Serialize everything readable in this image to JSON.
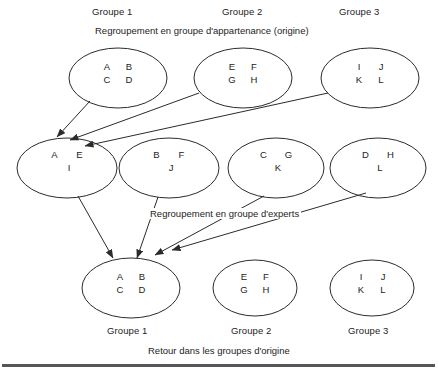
{
  "figure": {
    "title_top_caption": "Regroupement en groupe d'appartenance (origine)",
    "middle_caption": "Regroupement en groupe d'experts",
    "bottom_caption": "Retour dans les groupes d'origine",
    "top_group_labels": [
      "Groupe 1",
      "Groupe 2",
      "Groupe 3"
    ],
    "bottom_group_labels": [
      "Groupe 1",
      "Groupe 2",
      "Groupe 3"
    ],
    "stroke_color": "#2b2b2b",
    "rule_color": "#56565a",
    "text_color": "#1d1d1d",
    "background_color": "#ffffff"
  },
  "rows": {
    "origin_top": [
      {
        "name": "Groupe 1",
        "line1": [
          "A",
          "B"
        ],
        "line2": [
          "C",
          "D"
        ]
      },
      {
        "name": "Groupe 2",
        "line1": [
          "E",
          "F"
        ],
        "line2": [
          "G",
          "H"
        ]
      },
      {
        "name": "Groupe 3",
        "line1": [
          "I",
          "J"
        ],
        "line2": [
          "K",
          "L"
        ]
      }
    ],
    "experts_middle": [
      {
        "line1": [
          "A",
          "E"
        ],
        "line2": [
          "I"
        ]
      },
      {
        "line1": [
          "B",
          "F"
        ],
        "line2": [
          "J"
        ]
      },
      {
        "line1": [
          "C",
          "G"
        ],
        "line2": [
          "K"
        ]
      },
      {
        "line1": [
          "D",
          "H"
        ],
        "line2": [
          "L"
        ]
      }
    ],
    "origin_bottom": [
      {
        "name": "Groupe 1",
        "line1": [
          "A",
          "B"
        ],
        "line2": [
          "C",
          "D"
        ]
      },
      {
        "name": "Groupe 2",
        "line1": [
          "E",
          "F"
        ],
        "line2": [
          "G",
          "H"
        ]
      },
      {
        "name": "Groupe 3",
        "line1": [
          "I",
          "J"
        ],
        "line2": [
          "K",
          "L"
        ]
      }
    ]
  },
  "cells": {
    "top_1_l1a": "A",
    "top_1_l1b": "B",
    "top_1_l2a": "C",
    "top_1_l2b": "D",
    "top_2_l1a": "E",
    "top_2_l1b": "F",
    "top_2_l2a": "G",
    "top_2_l2b": "H",
    "top_3_l1a": "I",
    "top_3_l1b": "J",
    "top_3_l2a": "K",
    "top_3_l2b": "L",
    "mid_1_l1a": "A",
    "mid_1_l1b": "E",
    "mid_1_l2": "I",
    "mid_2_l1a": "B",
    "mid_2_l1b": "F",
    "mid_2_l2": "J",
    "mid_3_l1a": "C",
    "mid_3_l1b": "G",
    "mid_3_l2": "K",
    "mid_4_l1a": "D",
    "mid_4_l1b": "H",
    "mid_4_l2": "L",
    "bot_1_l1a": "A",
    "bot_1_l1b": "B",
    "bot_1_l2a": "C",
    "bot_1_l2b": "D",
    "bot_2_l1a": "E",
    "bot_2_l1b": "F",
    "bot_2_l2a": "G",
    "bot_2_l2b": "H",
    "bot_3_l1a": "I",
    "bot_3_l1b": "J",
    "bot_3_l2a": "K",
    "bot_3_l2b": "L"
  },
  "labels": {
    "top_g1": "Groupe 1",
    "top_g2": "Groupe 2",
    "top_g3": "Groupe 3",
    "bot_g1": "Groupe 1",
    "bot_g2": "Groupe 2",
    "bot_g3": "Groupe 3",
    "cap_top": "Regroupement en groupe d'appartenance (origine)",
    "cap_mid": "Regroupement en groupe d'experts",
    "cap_bot": "Retour dans les groupes d'origine"
  }
}
